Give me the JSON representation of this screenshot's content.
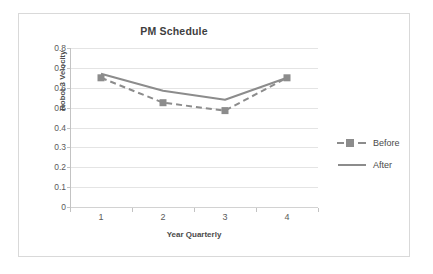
{
  "chart_data": {
    "type": "line",
    "title": "PM Schedule",
    "xlabel": "Year Quarterly",
    "ylabel": "Robot 3 Velocity",
    "categories": [
      "1",
      "2",
      "3",
      "4"
    ],
    "ylim": [
      0,
      0.8
    ],
    "yticks": [
      "0",
      "0.1",
      "0.2",
      "0.3",
      "0.4",
      "0.5",
      "0.6",
      "0.7",
      "0.8"
    ],
    "ytick_values": [
      0,
      0.1,
      0.2,
      0.3,
      0.4,
      0.5,
      0.6,
      0.7,
      0.8
    ],
    "grid": true,
    "legend_position": "right",
    "series": [
      {
        "name": "Before",
        "values": [
          0.65,
          0.525,
          0.485,
          0.65
        ],
        "style": "dashed",
        "marker": "square",
        "color": "#8c8c8c"
      },
      {
        "name": "After",
        "values": [
          0.67,
          0.585,
          0.54,
          0.65
        ],
        "style": "solid",
        "marker": "none",
        "color": "#8c8c8c"
      }
    ]
  },
  "legend": {
    "items": [
      {
        "label": "Before",
        "style": "dashed",
        "marker": "square"
      },
      {
        "label": "After",
        "style": "solid",
        "marker": "none"
      }
    ]
  },
  "colors": {
    "series": "#8c8c8c",
    "gridline": "#e4e4e4",
    "axis": "#c3c3c3",
    "text": "#4a4a4a",
    "frame": "#d9d9d9",
    "background": "#ffffff"
  }
}
